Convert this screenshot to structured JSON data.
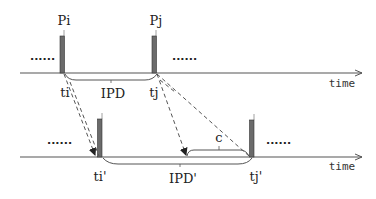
{
  "diagram": {
    "top_timeline": {
      "axis_label": "time",
      "packets": [
        {
          "name": "Pi",
          "time_label": "ti"
        },
        {
          "name": "Pj",
          "time_label": "tj"
        }
      ],
      "interval_label": "IPD",
      "ellipsis_left": "......",
      "ellipsis_right": "......"
    },
    "bottom_timeline": {
      "axis_label": "time",
      "packets": [
        {
          "time_label": "ti'"
        },
        {
          "time_label": "tj'"
        }
      ],
      "interval_label": "IPD'",
      "delay_label": "c",
      "ellipsis_left": "......",
      "ellipsis_right": "......"
    },
    "colors": {
      "bar": "#6b6b6b",
      "axis": "#555555",
      "dashed": "#555555"
    }
  }
}
